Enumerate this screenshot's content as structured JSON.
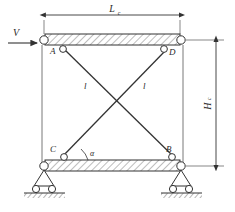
{
  "figure": {
    "type": "structural-mechanics-diagram",
    "stroke_color": "#3a3a3a",
    "hatch_color": "#555555",
    "background": "#ffffff"
  },
  "load": {
    "symbol": "V",
    "name": "lateral-shear-load",
    "arrow_direction": "right"
  },
  "dimensions": {
    "width": {
      "label": "L",
      "subscript": "c",
      "name": "frame-width"
    },
    "height": {
      "label": "H",
      "subscript": "c",
      "name": "frame-height"
    }
  },
  "members": {
    "diagonal_left": {
      "label": "l",
      "from": "A",
      "to": "B"
    },
    "diagonal_right": {
      "label": "l",
      "from": "D",
      "to": "C"
    }
  },
  "angle": {
    "symbol": "α",
    "at_joint": "C",
    "name": "brace-inclination-angle"
  },
  "joints": [
    {
      "id": "A",
      "label": "A",
      "position": "top-left"
    },
    {
      "id": "D",
      "label": "D",
      "position": "top-right"
    },
    {
      "id": "C",
      "label": "C",
      "position": "bottom-left"
    },
    {
      "id": "B",
      "label": "B",
      "position": "bottom-right"
    }
  ],
  "beams": [
    {
      "name": "top-beam",
      "hatched": true
    },
    {
      "name": "bottom-beam",
      "hatched": true
    }
  ],
  "supports": [
    {
      "name": "left-roller-support",
      "rollers": 2
    },
    {
      "name": "right-roller-support",
      "rollers": 2
    }
  ]
}
